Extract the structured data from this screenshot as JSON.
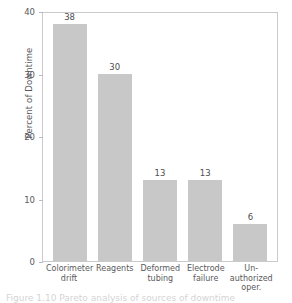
{
  "chart_data": {
    "type": "bar",
    "title": "",
    "xlabel": "",
    "ylabel": "Percent of Downtime",
    "categories": [
      "Colorimeter drift",
      "Reagents",
      "Deformed tubing",
      "Electrode failure",
      "Un-authorized oper."
    ],
    "category_lines": [
      [
        "Colorimeter",
        "drift"
      ],
      [
        "Reagents"
      ],
      [
        "Deformed",
        "tubing"
      ],
      [
        "Electrode",
        "failure"
      ],
      [
        "Un-",
        "authorized",
        "oper."
      ]
    ],
    "values": [
      38,
      30,
      13,
      13,
      6
    ],
    "value_labels": [
      "38",
      "30",
      "13",
      "13",
      "6"
    ],
    "ylim": [
      0,
      40
    ],
    "yticks": [
      0,
      10,
      20,
      30,
      40
    ],
    "ytick_labels": [
      "0",
      "10",
      "20",
      "30",
      "40"
    ],
    "grid": false,
    "legend": null,
    "bar_color": "#c8c8c8",
    "frame_color": "#c9cacc",
    "text_color": "#59595b"
  },
  "figure": {
    "caption_fragment": "Figure 1.10  Pareto analysis of sources of downtime"
  }
}
